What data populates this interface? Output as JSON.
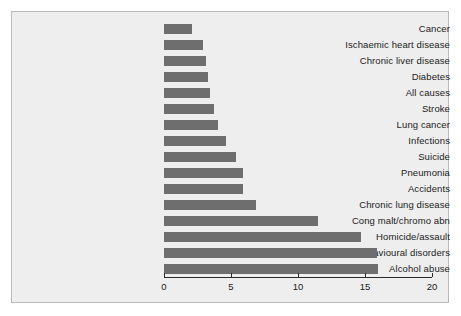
{
  "chart_data": {
    "type": "bar",
    "orientation": "horizontal",
    "title": "",
    "subtitle": "",
    "xlabel": "",
    "ylabel": "",
    "xlim": [
      0,
      20
    ],
    "ylim": null,
    "grid": false,
    "legend": null,
    "xticks": [
      "0",
      "5",
      "10",
      "15",
      "20"
    ],
    "xtick_values": [
      0,
      5,
      10,
      15,
      20
    ],
    "categories": [
      "Cancer",
      "Ischaemic heart disease",
      "Chronic liver disease",
      "Diabetes",
      "All causes",
      "Stroke",
      "Lung cancer",
      "Infections",
      "Suicide",
      "Pneumonia",
      "Accidents",
      "Chronic lung disease",
      "Cong malt/chromo abn",
      "Homicide/assault",
      "Mental/behavioural disorders",
      "Alcohol abuse"
    ],
    "values": [
      2.1,
      2.9,
      3.1,
      3.3,
      3.4,
      3.7,
      4.0,
      4.6,
      5.4,
      5.9,
      5.9,
      6.9,
      11.5,
      14.7,
      15.9,
      16.0
    ],
    "bar_color": "#6e6e6e",
    "panel_color": "#eeeeee",
    "axis_color": "#2b2b2b",
    "text_color": "#1b1b1b"
  }
}
